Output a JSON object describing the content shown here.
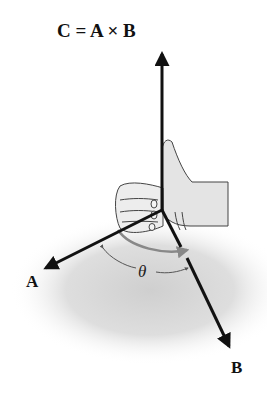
{
  "figure": {
    "title": "C = A × B",
    "vectors": [
      {
        "name": "C",
        "role": "cross-product result",
        "direction": "up"
      },
      {
        "name": "A",
        "direction": "lower-left"
      },
      {
        "name": "B",
        "direction": "lower-right"
      }
    ],
    "labels": {
      "a": "A",
      "b": "B",
      "angle": "θ"
    },
    "icons": {
      "hand": "right-hand-thumbs-up-icon"
    },
    "colors": {
      "arrow": "#111111",
      "curl_arrow": "#777777",
      "shadow": "#d9d9d9",
      "background": "#ffffff"
    }
  }
}
